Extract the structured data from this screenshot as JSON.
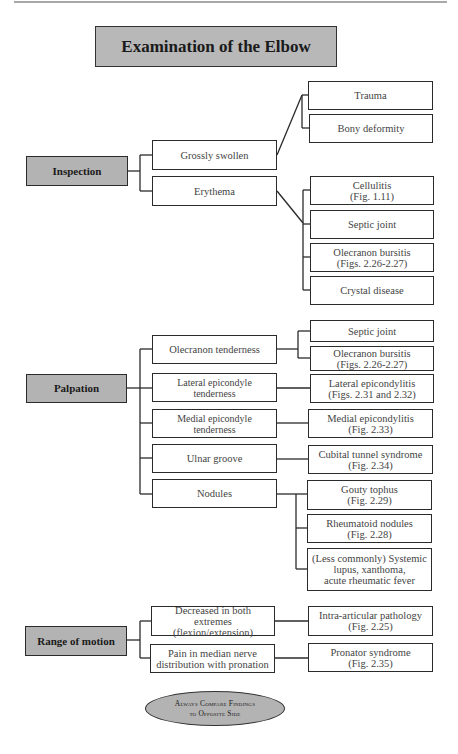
{
  "title": "Examination of the Elbow",
  "sections": {
    "inspection": {
      "label": "Inspection",
      "findings": [
        {
          "label": "Grossly swollen",
          "causes": [
            "Trauma",
            "Bony deformity"
          ]
        },
        {
          "label": "Erythema",
          "causes": [
            "Cellulitis\n(Fig. 1.11)",
            "Septic joint",
            "Olecranon bursitis\n(Figs. 2.26-2.27)",
            "Crystal disease"
          ]
        }
      ]
    },
    "palpation": {
      "label": "Palpation",
      "findings": [
        {
          "label": "Olecranon tenderness",
          "causes": [
            "Septic joint",
            "Olecranon bursitis\n(Figs. 2.26-2.27)"
          ]
        },
        {
          "label": "Lateral epicondyle tenderness",
          "causes": [
            "Lateral epicondylitis\n(Figs. 2.31 and 2.32)"
          ]
        },
        {
          "label": "Medial epicondyle tenderness",
          "causes": [
            "Medial epicondylitis\n(Fig. 2.33)"
          ]
        },
        {
          "label": "Ulnar groove",
          "causes": [
            "Cubital tunnel syndrome\n(Fig. 2.34)"
          ]
        },
        {
          "label": "Nodules",
          "causes": [
            "Gouty tophus\n(Fig. 2.29)",
            "Rheumatoid nodules\n(Fig. 2.28)",
            "(Less commonly) Systemic\nlupus, xanthoma,\nacute rheumatic fever"
          ]
        }
      ]
    },
    "range_of_motion": {
      "label": "Range of motion",
      "findings": [
        {
          "label": "Decreased in both\nextremes (flexion/extension)",
          "causes": [
            "Intra-articular pathology\n(Fig. 2.25)"
          ]
        },
        {
          "label": "Pain in median nerve\ndistribution with pronation",
          "causes": [
            "Pronator syndrome\n(Fig. 2.35)"
          ]
        }
      ]
    }
  },
  "footer_note": {
    "line1": "Always Compare Findings",
    "line2": "to Opposite Side"
  },
  "colors": {
    "box_fill_gray": "#b3b3b3",
    "border": "#2b2b2b",
    "text": "#444444"
  }
}
